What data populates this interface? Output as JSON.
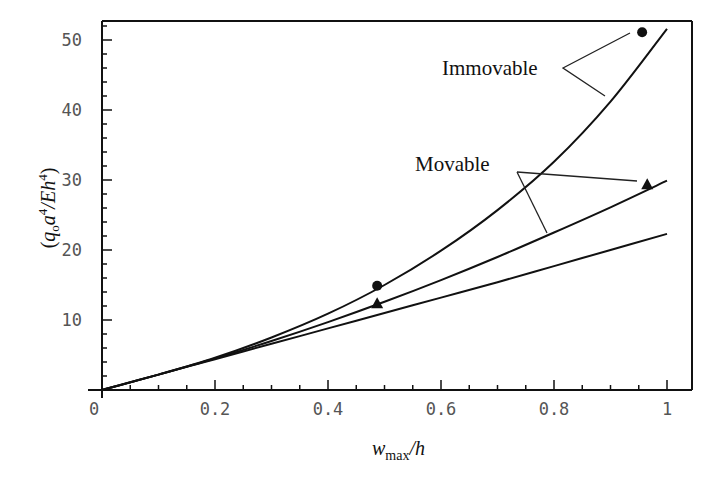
{
  "chart_data": {
    "type": "line",
    "title": "",
    "xlabel": "w_max/h",
    "xlabel_parts": {
      "main": "w",
      "sub": "max",
      "tail": "/h"
    },
    "ylabel": "(q_o a^4/Eh^4)",
    "ylabel_parts": {
      "open": "(",
      "q": "q",
      "qsub": "o",
      "a": "a",
      "asup": "4",
      "mid": "/Eh",
      "hsup": "4",
      "close": ")"
    },
    "xlim": [
      0,
      1.04
    ],
    "ylim": [
      0,
      52.7
    ],
    "xticks": [
      0,
      0.2,
      0.4,
      0.6,
      0.8,
      1
    ],
    "xtick_labels": [
      "0",
      "0.2",
      "0.4",
      "0.6",
      "0.8",
      "1"
    ],
    "yticks": [
      10,
      20,
      30,
      40,
      50
    ],
    "ytick_labels": [
      "10",
      "20",
      "30",
      "40",
      "50"
    ],
    "grid": false,
    "legend": null,
    "series": [
      {
        "name": "Immovable (theory)",
        "x": [
          0,
          0.1,
          0.2,
          0.3,
          0.4,
          0.5,
          0.6,
          0.7,
          0.8,
          0.9,
          1.0
        ],
        "y": [
          0,
          2.2,
          4.6,
          7.5,
          10.9,
          15.0,
          19.9,
          25.7,
          32.6,
          41.2,
          51.6
        ]
      },
      {
        "name": "Movable (theory)",
        "x": [
          0,
          0.1,
          0.2,
          0.3,
          0.4,
          0.5,
          0.6,
          0.7,
          0.8,
          0.9,
          1.0
        ],
        "y": [
          0,
          2.2,
          4.5,
          7.0,
          9.7,
          12.6,
          15.7,
          19.0,
          22.5,
          26.1,
          29.9
        ]
      },
      {
        "name": "Linear-like lower curve",
        "x": [
          0,
          0.1,
          0.2,
          0.3,
          0.4,
          0.5,
          0.6,
          0.7,
          0.8,
          0.9,
          1.0
        ],
        "y": [
          0,
          2.2,
          4.4,
          6.6,
          8.8,
          11.0,
          13.2,
          15.4,
          17.7,
          20.0,
          22.3
        ]
      }
    ],
    "points": [
      {
        "name": "Immovable data",
        "marker": "circle",
        "x": [
          0.487,
          0.956
        ],
        "y": [
          14.9,
          51.1
        ]
      },
      {
        "name": "Movable data",
        "marker": "triangle",
        "x": [
          0.487,
          0.965
        ],
        "y": [
          12.4,
          29.4
        ]
      }
    ],
    "annotations": [
      {
        "text": "Immovable",
        "x": 0.6,
        "y": 44
      },
      {
        "text": "Movable",
        "x": 0.56,
        "y": 31.5
      }
    ]
  }
}
